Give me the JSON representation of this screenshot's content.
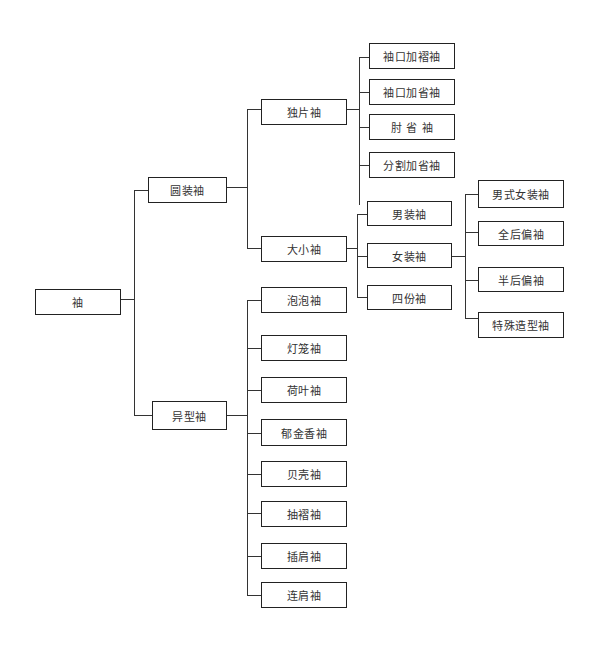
{
  "diagram": {
    "type": "tree",
    "root": "袖",
    "nodes": {
      "root": {
        "label": "袖"
      },
      "yuanzhuang": {
        "label": "圆装袖"
      },
      "yixing": {
        "label": "异型袖"
      },
      "dupian": {
        "label": "独片袖"
      },
      "daxiao": {
        "label": "大小袖"
      },
      "xiukou_zhe": {
        "label": "袖口加褶袖"
      },
      "xiukou_sheng": {
        "label": "袖口加省袖"
      },
      "zhousheng": {
        "label": "肘 省 袖"
      },
      "fenge": {
        "label": "分割加省袖"
      },
      "nanzhuang": {
        "label": "男装袖"
      },
      "nvzhuang": {
        "label": "女装袖"
      },
      "sifen": {
        "label": "四份袖"
      },
      "nanshi_nv": {
        "label": "男式女装袖"
      },
      "quanhou": {
        "label": "全后偏袖"
      },
      "banhou": {
        "label": "半后偏袖"
      },
      "teshu": {
        "label": "特殊造型袖"
      },
      "paopao": {
        "label": "泡泡袖"
      },
      "denglong": {
        "label": "灯笼袖"
      },
      "heye": {
        "label": "荷叶袖"
      },
      "yujinxiang": {
        "label": "郁金香袖"
      },
      "beike": {
        "label": "贝壳袖"
      },
      "chouzhe": {
        "label": "抽褶袖"
      },
      "chajian": {
        "label": "插肩袖"
      },
      "lianjian": {
        "label": "连肩袖"
      }
    },
    "edges": [
      [
        "root",
        "yuanzhuang"
      ],
      [
        "root",
        "yixing"
      ],
      [
        "yuanzhuang",
        "dupian"
      ],
      [
        "yuanzhuang",
        "daxiao"
      ],
      [
        "dupian",
        "xiukou_zhe"
      ],
      [
        "dupian",
        "xiukou_sheng"
      ],
      [
        "dupian",
        "zhousheng"
      ],
      [
        "dupian",
        "fenge"
      ],
      [
        "daxiao",
        "nanzhuang"
      ],
      [
        "daxiao",
        "nvzhuang"
      ],
      [
        "daxiao",
        "sifen"
      ],
      [
        "nvzhuang",
        "nanshi_nv"
      ],
      [
        "nvzhuang",
        "quanhou"
      ],
      [
        "nvzhuang",
        "banhou"
      ],
      [
        "nvzhuang",
        "teshu"
      ],
      [
        "yixing",
        "paopao"
      ],
      [
        "yixing",
        "denglong"
      ],
      [
        "yixing",
        "heye"
      ],
      [
        "yixing",
        "yujinxiang"
      ],
      [
        "yixing",
        "beike"
      ],
      [
        "yixing",
        "chouzhe"
      ],
      [
        "yixing",
        "chajian"
      ],
      [
        "yixing",
        "lianjian"
      ]
    ]
  }
}
